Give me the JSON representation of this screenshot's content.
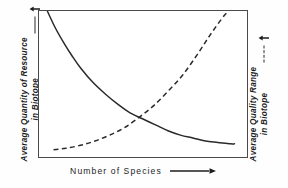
{
  "figure": {
    "background_color": "#fefefe",
    "frame_color": "#4a4a4a",
    "ink_color": "#1d1d1d"
  },
  "axes": {
    "left": {
      "line_1": "Average Quantity of Resource",
      "line_2": "in Biotope",
      "direction_arrow": "up-arrow-icon",
      "legend_style": "solid"
    },
    "right": {
      "line_1": "Average Quality Range",
      "line_2": "in Biotope",
      "direction_arrow": "up-arrow-icon",
      "legend_style": "dashed"
    },
    "bottom": {
      "label": "Number  of  Species",
      "direction_arrow": "right-arrow-icon"
    }
  },
  "chart_data": {
    "type": "line",
    "title": "",
    "xlabel": "Number of Species",
    "ylabel": "Average Quantity of Resource in Biotope",
    "y2label": "Average Quality Range in Biotope",
    "grid": false,
    "legend_position": "axis-labels",
    "xlim": [
      0,
      100
    ],
    "ylim": [
      0,
      100
    ],
    "xticks": [],
    "yticks": [],
    "annotations": [
      "Curves cross near the lower middle of the plot",
      "Solid curve decays hyperbolically from top-left to a low plateau",
      "Dashed curve rises slowly then steeply, exiting through the top edge"
    ],
    "series": [
      {
        "name": "Average Quantity of Resource in Biotope",
        "style": "solid",
        "color": "#2a2a2a",
        "axis": "left",
        "x": [
          4,
          8,
          12,
          16,
          20,
          26,
          32,
          38,
          44,
          50,
          56,
          62,
          68,
          74,
          80,
          86,
          92,
          94
        ],
        "y": [
          100,
          88,
          78,
          69,
          61,
          51,
          43,
          36,
          30,
          26,
          22,
          18,
          15,
          13,
          11,
          10,
          9,
          9
        ]
      },
      {
        "name": "Average Quality Range in Biotope",
        "style": "dashed",
        "color": "#2a2a2a",
        "axis": "right",
        "x": [
          7,
          13,
          20,
          27,
          34,
          41,
          48,
          55,
          62,
          69,
          76,
          82,
          88,
          91
        ],
        "y": [
          5,
          6,
          8,
          11,
          15,
          20,
          27,
          35,
          45,
          56,
          70,
          83,
          95,
          100
        ]
      }
    ]
  }
}
